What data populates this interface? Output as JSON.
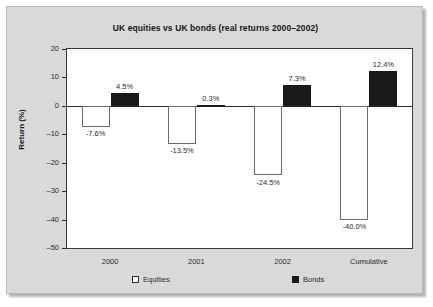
{
  "chart_data": {
    "type": "bar",
    "title": "UK equities vs UK bonds (real returns 2000–2002)",
    "xlabel": "",
    "ylabel": "Return (%)",
    "categories": [
      "2000",
      "2001",
      "2002",
      "Cumulative"
    ],
    "ylim": [
      -50,
      20
    ],
    "ytick_values": [
      20,
      10,
      0,
      -10,
      -20,
      -30,
      -40,
      -50
    ],
    "ytick_labels": [
      "20",
      "10",
      "0",
      "–10",
      "–20",
      "–30",
      "–40",
      "–50"
    ],
    "grid": false,
    "legend_position": "bottom",
    "series": [
      {
        "name": "Equities",
        "color": "#ffffff",
        "values": [
          -7.6,
          -13.5,
          -24.5,
          -40.0
        ],
        "data_labels": [
          "-7.6%",
          "-13.5%",
          "-24.5%",
          "-40.0%"
        ]
      },
      {
        "name": "Bonds",
        "color": "#1a1a1a",
        "values": [
          4.5,
          0.3,
          7.3,
          12.4
        ],
        "data_labels": [
          "4.5%",
          "0.3%",
          "7.3%",
          "12.4%"
        ]
      }
    ]
  },
  "legend": {
    "entries": [
      {
        "label": "Equities",
        "swatch": "equities"
      },
      {
        "label": "Bonds",
        "swatch": "bonds"
      }
    ]
  }
}
